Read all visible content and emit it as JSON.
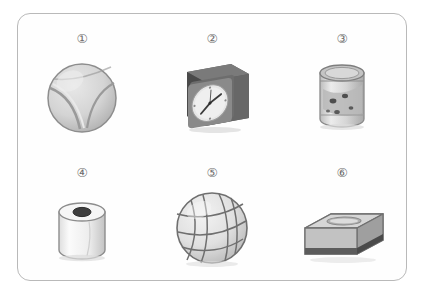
{
  "worksheet": {
    "background_color": "#ffffff",
    "border_color": "#b9b9b9",
    "label_color": "#6e6e6e",
    "columns": 3,
    "rows": 2,
    "items": [
      {
        "number": "①",
        "icon": "tennis-ball-icon",
        "name": "tennis ball",
        "shape": "sphere",
        "fill": "#d7d7d7",
        "outline": "#8d8d8d"
      },
      {
        "number": "②",
        "icon": "cube-alarm-clock-icon",
        "name": "square clock",
        "shape": "cube",
        "fill": "#6a6a6a",
        "outline": "#3c3c3c"
      },
      {
        "number": "③",
        "icon": "tin-can-icon",
        "name": "tin can",
        "shape": "cylinder",
        "fill": "#d2d2d2",
        "outline": "#8a8a8a"
      },
      {
        "number": "④",
        "icon": "paper-roll-icon",
        "name": "paper roll",
        "shape": "cylinder",
        "fill": "#f2f2f2",
        "outline": "#8d8d8d"
      },
      {
        "number": "⑤",
        "icon": "volleyball-icon",
        "name": "volleyball",
        "shape": "sphere",
        "fill": "#e3e3e3",
        "outline": "#767676"
      },
      {
        "number": "⑥",
        "icon": "tissue-box-icon",
        "name": "tissue box",
        "shape": "cuboid",
        "fill": "#c9c9c9",
        "outline": "#707070"
      }
    ]
  }
}
